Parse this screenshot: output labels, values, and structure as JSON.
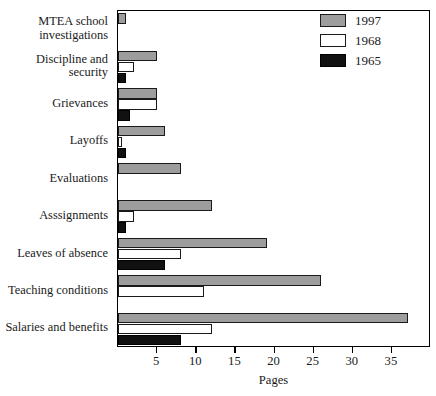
{
  "chart_data": {
    "type": "bar",
    "orientation": "horizontal",
    "title": "",
    "xlabel": "Pages",
    "ylabel": "",
    "xlim": [
      0,
      40
    ],
    "xticks": [
      5,
      10,
      15,
      20,
      25,
      30,
      35
    ],
    "xtick_labels": [
      "5",
      "10",
      "15",
      "20",
      "25",
      "30",
      "35"
    ],
    "grid": false,
    "legend_position": "top-right",
    "categories": [
      "MTEA school\ninvestigations",
      "Discipline and\nsecurity",
      "Grievances",
      "Layoffs",
      "Evaluations",
      "Asssignments",
      "Leaves of absence",
      "Teaching conditions",
      "Salaries and benefits"
    ],
    "series": [
      {
        "name": "1997",
        "color": "#9d9d9d",
        "values": [
          1,
          5,
          5,
          6,
          8,
          12,
          19,
          26,
          37
        ]
      },
      {
        "name": "1968",
        "color": "#ffffff",
        "values": [
          0,
          2,
          5,
          0.5,
          0,
          2,
          8,
          11,
          12
        ]
      },
      {
        "name": "1965",
        "color": "#111111",
        "values": [
          0,
          1,
          1.5,
          1,
          0,
          1,
          6,
          0,
          8
        ]
      }
    ]
  },
  "legend": {
    "entries": [
      {
        "label": "1997",
        "swatch": "gray"
      },
      {
        "label": "1968",
        "swatch": "white"
      },
      {
        "label": "1965",
        "swatch": "black"
      }
    ]
  },
  "axis": {
    "x_title": "Pages"
  }
}
